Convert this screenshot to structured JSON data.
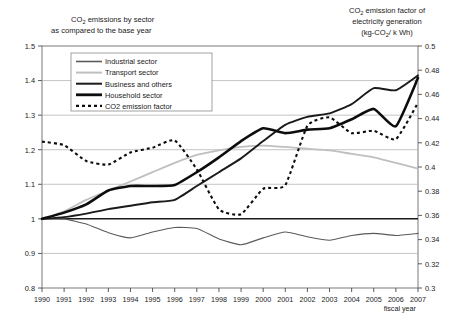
{
  "chart_data": {
    "type": "line",
    "title_left": "CO₂ emissions by sector as compared to the base year",
    "title_left_line1": "CO",
    "title_left_sub1": "2",
    "title_left_line1b": " emissions by sector",
    "title_left_line2": "as compared to the base year",
    "title_right_line1a": "CO",
    "title_right_sub1": "2",
    "title_right_line1b": " emission factor of",
    "title_right_line2": "electricity generation",
    "title_right_line3a": "(kg-CO",
    "title_right_sub3": "2",
    "title_right_line3b": "/ k Wh)",
    "xlabel": "fiscal year",
    "ylabel_left": "",
    "ylabel_right": "",
    "grid": true,
    "legend_position": "top-left-inside",
    "x": [
      1990,
      1991,
      1992,
      1993,
      1994,
      1995,
      1996,
      1997,
      1998,
      1999,
      2000,
      2001,
      2002,
      2003,
      2004,
      2005,
      2006,
      2007
    ],
    "xticklabels": [
      "1990",
      "1991",
      "1992",
      "1993",
      "1994",
      "1995",
      "1996",
      "1997",
      "1998",
      "1999",
      "2000",
      "2001",
      "2002",
      "2003",
      "2004",
      "2005",
      "2006",
      "2007"
    ],
    "ylim_left": [
      0.8,
      1.5
    ],
    "yticks_left": [
      "1.5",
      "1.4",
      "1.3",
      "1.2",
      "1.1",
      "1",
      "0.9",
      "0.8"
    ],
    "ytickvalues_left": [
      1.5,
      1.4,
      1.3,
      1.2,
      1.1,
      1.0,
      0.9,
      0.8
    ],
    "ylim_right": [
      0.3,
      0.5
    ],
    "yticks_right": [
      "0.5",
      "0.48",
      "0.46",
      "0.44",
      "0.42",
      "0.4",
      "0.38",
      "0.36",
      "0.34",
      "0.32",
      "0.3"
    ],
    "ytickvalues_right": [
      0.5,
      0.48,
      0.46,
      0.44,
      0.42,
      0.4,
      0.38,
      0.36,
      0.34,
      0.32,
      0.3
    ],
    "series": [
      {
        "name": "Industrial sector",
        "axis": "left",
        "color": "#5a5a5a",
        "width": 1.1,
        "dash": "none",
        "values": [
          1.0,
          1.0,
          0.985,
          0.96,
          0.945,
          0.962,
          0.975,
          0.972,
          0.942,
          0.925,
          0.945,
          0.962,
          0.948,
          0.938,
          0.952,
          0.958,
          0.952,
          0.958
        ]
      },
      {
        "name": "Transport sector",
        "axis": "left",
        "color": "#bfbfbf",
        "width": 1.8,
        "dash": "none",
        "values": [
          1.0,
          1.022,
          1.055,
          1.082,
          1.108,
          1.135,
          1.162,
          1.185,
          1.198,
          1.208,
          1.212,
          1.208,
          1.203,
          1.198,
          1.188,
          1.178,
          1.162,
          1.145
        ]
      },
      {
        "name": "Business and others",
        "axis": "left",
        "color": "#1a1a1a",
        "width": 1.9,
        "dash": "none",
        "values": [
          1.0,
          1.005,
          1.015,
          1.028,
          1.038,
          1.048,
          1.055,
          1.095,
          1.135,
          1.175,
          1.225,
          1.272,
          1.295,
          1.305,
          1.332,
          1.378,
          1.372,
          1.415
        ]
      },
      {
        "name": "Household sector",
        "axis": "left",
        "color": "#0d0d0d",
        "width": 2.6,
        "dash": "none",
        "values": [
          1.0,
          1.018,
          1.042,
          1.082,
          1.095,
          1.095,
          1.098,
          1.135,
          1.178,
          1.225,
          1.262,
          1.248,
          1.258,
          1.262,
          1.288,
          1.318,
          1.268,
          1.408
        ]
      },
      {
        "name": "CO2 emission factor",
        "axis": "right",
        "color": "#0d0d0d",
        "width": 2.1,
        "dash": "3,3",
        "values": [
          0.421,
          0.418,
          0.405,
          0.402,
          0.412,
          0.416,
          0.422,
          0.398,
          0.365,
          0.361,
          0.382,
          0.385,
          0.434,
          0.441,
          0.428,
          0.43,
          0.423,
          0.453
        ]
      }
    ],
    "legend_items": [
      {
        "label": "Industrial sector",
        "color": "#5a5a5a",
        "width": 1.6,
        "dash": "none"
      },
      {
        "label": "Transport sector",
        "color": "#bfbfbf",
        "width": 2.0,
        "dash": "none"
      },
      {
        "label": "Business and others",
        "color": "#1a1a1a",
        "width": 2.0,
        "dash": "none"
      },
      {
        "label": "Household sector",
        "color": "#0d0d0d",
        "width": 2.8,
        "dash": "none"
      },
      {
        "label": "CO2 emission factor",
        "color": "#0d0d0d",
        "width": 2.2,
        "dash": "3,3"
      }
    ]
  }
}
